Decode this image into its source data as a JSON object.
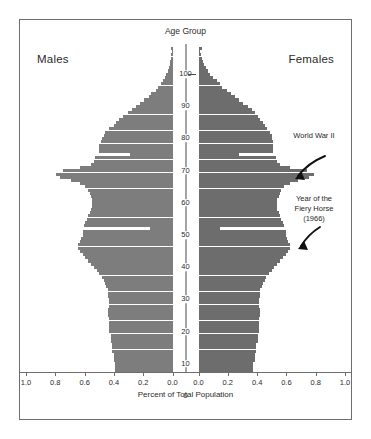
{
  "figure": {
    "males_label": "Males",
    "females_label": "Females",
    "y_axis_title": "Age Group",
    "x_axis_title": "Percent of Total Population"
  },
  "annotations": [
    {
      "name": "world-war-ii",
      "text": "World War II"
    },
    {
      "name": "fiery-horse",
      "text": "Year of the\nFiery Horse\n(1966)"
    }
  ],
  "chart_data": {
    "type": "bar",
    "orientation": "horizontal",
    "subtype": "population-pyramid",
    "title": "",
    "xlabel": "Percent of Total Population",
    "ylabel": "Age Group",
    "xlim": [
      1.0,
      1.0
    ],
    "ylim": [
      0,
      100
    ],
    "grid": false,
    "legend": false,
    "x_tick_labels_left": [
      "1.0",
      "0.8",
      "0.6",
      "0.4",
      "0.2",
      "0.0"
    ],
    "x_tick_labels_right": [
      "0.0",
      "0.2",
      "0.4",
      "0.6",
      "0.8",
      "1.0"
    ],
    "x_tick_values": [
      1.0,
      0.8,
      0.6,
      0.4,
      0.2,
      0.0
    ],
    "y_tick_labels": [
      "0",
      "10",
      "20",
      "30",
      "40",
      "50",
      "60",
      "70",
      "80",
      "90",
      "100"
    ],
    "y_tick_values": [
      0,
      10,
      20,
      30,
      40,
      50,
      60,
      70,
      80,
      90,
      100
    ],
    "colors": {
      "males": "#7d7d7d",
      "females": "#6d6d6d",
      "axis": "#4a4a4a",
      "frame": "#6e6e6e"
    },
    "ages": [
      0,
      1,
      2,
      3,
      4,
      5,
      6,
      7,
      8,
      9,
      10,
      11,
      12,
      13,
      14,
      15,
      16,
      17,
      18,
      19,
      20,
      21,
      22,
      23,
      24,
      25,
      26,
      27,
      28,
      29,
      30,
      31,
      32,
      33,
      34,
      35,
      36,
      37,
      38,
      39,
      40,
      41,
      42,
      43,
      44,
      45,
      46,
      47,
      48,
      49,
      50,
      51,
      52,
      53,
      54,
      55,
      56,
      57,
      58,
      59,
      60,
      61,
      62,
      63,
      64,
      65,
      66,
      67,
      68,
      69,
      70,
      71,
      72,
      73,
      74,
      75,
      76,
      77,
      78,
      79,
      80,
      81,
      82,
      83,
      84,
      85,
      86,
      87,
      88,
      89,
      90,
      91,
      92,
      93,
      94,
      95,
      96,
      97,
      98,
      99,
      100
    ],
    "series": [
      {
        "name": "Males",
        "side": "left",
        "values": [
          0.41,
          0.41,
          0.41,
          0.42,
          0.42,
          0.42,
          0.43,
          0.43,
          0.43,
          0.44,
          0.44,
          0.44,
          0.45,
          0.45,
          0.45,
          0.45,
          0.45,
          0.46,
          0.46,
          0.46,
          0.45,
          0.45,
          0.45,
          0.46,
          0.46,
          0.46,
          0.47,
          0.48,
          0.49,
          0.5,
          0.52,
          0.54,
          0.56,
          0.58,
          0.6,
          0.62,
          0.64,
          0.66,
          0.67,
          0.67,
          0.66,
          0.65,
          0.64,
          0.64,
          0.16,
          0.63,
          0.62,
          0.61,
          0.6,
          0.59,
          0.58,
          0.57,
          0.57,
          0.57,
          0.58,
          0.59,
          0.6,
          0.62,
          0.66,
          0.72,
          0.8,
          0.83,
          0.78,
          0.66,
          0.58,
          0.56,
          0.55,
          0.3,
          0.52,
          0.52,
          0.52,
          0.51,
          0.5,
          0.49,
          0.48,
          0.45,
          0.42,
          0.4,
          0.38,
          0.35,
          0.32,
          0.29,
          0.26,
          0.23,
          0.2,
          0.17,
          0.15,
          0.12,
          0.1,
          0.085,
          0.07,
          0.055,
          0.045,
          0.035,
          0.027,
          0.02,
          0.015,
          0.011,
          0.008,
          0.005,
          0.012
        ]
      },
      {
        "name": "Females",
        "side": "right",
        "values": [
          0.39,
          0.39,
          0.39,
          0.4,
          0.4,
          0.4,
          0.41,
          0.41,
          0.41,
          0.42,
          0.42,
          0.42,
          0.43,
          0.43,
          0.43,
          0.43,
          0.43,
          0.44,
          0.44,
          0.44,
          0.43,
          0.43,
          0.43,
          0.44,
          0.44,
          0.44,
          0.45,
          0.46,
          0.47,
          0.48,
          0.5,
          0.52,
          0.54,
          0.56,
          0.58,
          0.6,
          0.62,
          0.64,
          0.65,
          0.65,
          0.64,
          0.63,
          0.62,
          0.62,
          0.15,
          0.61,
          0.6,
          0.59,
          0.58,
          0.57,
          0.56,
          0.56,
          0.56,
          0.56,
          0.57,
          0.58,
          0.59,
          0.61,
          0.65,
          0.71,
          0.79,
          0.82,
          0.77,
          0.65,
          0.58,
          0.56,
          0.55,
          0.29,
          0.53,
          0.53,
          0.53,
          0.53,
          0.52,
          0.52,
          0.51,
          0.49,
          0.47,
          0.46,
          0.44,
          0.42,
          0.4,
          0.38,
          0.35,
          0.32,
          0.29,
          0.26,
          0.23,
          0.2,
          0.17,
          0.15,
          0.13,
          0.105,
          0.085,
          0.068,
          0.053,
          0.04,
          0.03,
          0.022,
          0.016,
          0.011,
          0.022
        ]
      }
    ]
  }
}
